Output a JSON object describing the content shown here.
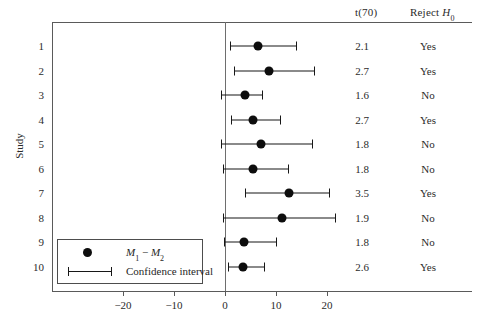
{
  "chart_data": {
    "type": "scatter",
    "title": "",
    "xlabel": "",
    "ylabel": "Study",
    "xlim": [
      -29.4,
      48.4
    ],
    "ylim": [
      0.5,
      10.5
    ],
    "grid": false,
    "legend_position": "lower-left-inside",
    "x_ticks": [
      -20,
      -10,
      0,
      10,
      20
    ],
    "x_tick_labels": [
      "−20",
      "−10",
      "0",
      "10",
      "20"
    ],
    "y_ticks": [
      1,
      2,
      3,
      4,
      5,
      6,
      7,
      8,
      9,
      10
    ],
    "y_tick_labels": [
      "1",
      "2",
      "3",
      "4",
      "5",
      "6",
      "7",
      "8",
      "9",
      "10"
    ],
    "reference_line_x": 0,
    "columns": [
      "Study",
      "M1 − M2",
      "Confidence interval",
      "t(70)",
      "Reject H0"
    ],
    "series": [
      {
        "name": "M1 − M2 with 95% confidence interval",
        "point_marker": "filled-circle",
        "rows": [
          {
            "study": "1",
            "estimate": 6.5,
            "ci_low": 1.0,
            "ci_high": 14.0,
            "t": "2.1",
            "reject": "Yes"
          },
          {
            "study": "2",
            "estimate": 8.6,
            "ci_low": 1.8,
            "ci_high": 17.5,
            "t": "2.7",
            "reject": "Yes"
          },
          {
            "study": "3",
            "estimate": 3.9,
            "ci_low": -0.7,
            "ci_high": 7.3,
            "t": "1.6",
            "reject": "No"
          },
          {
            "study": "4",
            "estimate": 5.5,
            "ci_low": 1.2,
            "ci_high": 10.8,
            "t": "2.7",
            "reject": "Yes"
          },
          {
            "study": "5",
            "estimate": 7.0,
            "ci_low": -0.7,
            "ci_high": 17.0,
            "t": "1.8",
            "reject": "No"
          },
          {
            "study": "6",
            "estimate": 5.5,
            "ci_low": -0.3,
            "ci_high": 12.4,
            "t": "1.8",
            "reject": "No"
          },
          {
            "study": "7",
            "estimate": 12.5,
            "ci_low": 4.0,
            "ci_high": 20.4,
            "t": "3.5",
            "reject": "Yes"
          },
          {
            "study": "8",
            "estimate": 11.2,
            "ci_low": -0.3,
            "ci_high": 21.6,
            "t": "1.9",
            "reject": "No"
          },
          {
            "study": "9",
            "estimate": 3.8,
            "ci_low": -0.2,
            "ci_high": 10.0,
            "t": "1.8",
            "reject": "No"
          },
          {
            "study": "10",
            "estimate": 3.5,
            "ci_low": 0.6,
            "ci_high": 7.7,
            "t": "2.6",
            "reject": "Yes"
          }
        ]
      }
    ]
  },
  "headers": {
    "t_stat": "t(70)",
    "reject_prefix": "Reject ",
    "reject_symbol": "H",
    "reject_subscript": "0"
  },
  "axis": {
    "y_title": "Study"
  },
  "legend": {
    "estimate_label_m": "M",
    "estimate_label_sub1": "1",
    "estimate_label_minus": " − ",
    "estimate_label_sub2": "2",
    "ci_label": "Confidence interval"
  },
  "colors": {
    "marker": "#0d0d0d",
    "line": "#171717",
    "axis": "#5a5a5a",
    "text": "#2b2b2b",
    "background": "#ffffff"
  }
}
